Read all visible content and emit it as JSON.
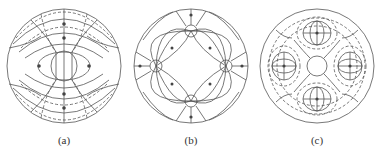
{
  "figure": {
    "panels": [
      {
        "id": "a",
        "label": "(a)",
        "description": "Field pattern with one central pole pair; concentric ring field lines"
      },
      {
        "id": "b",
        "label": "(b)",
        "description": "Field pattern with four poles at cardinal positions"
      },
      {
        "id": "c",
        "label": "(c)",
        "description": "Field pattern with four pole pairs, dense mesh"
      }
    ],
    "colors": {
      "line": "#555555",
      "background": "#ffffff"
    }
  }
}
